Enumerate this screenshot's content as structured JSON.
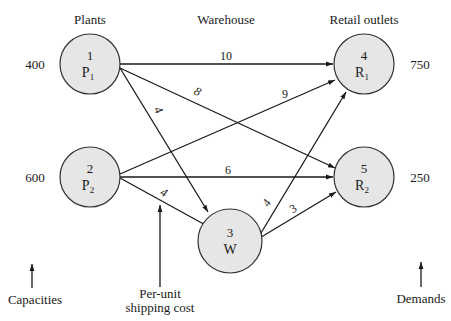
{
  "headers": {
    "plants": "Plants",
    "warehouse": "Warehouse",
    "retail": "Retail outlets"
  },
  "nodes": [
    {
      "id": "1",
      "label": "P",
      "sub": "1",
      "role": "plant",
      "cx": 90,
      "cy": 64,
      "side_value": "400"
    },
    {
      "id": "2",
      "label": "P",
      "sub": "2",
      "role": "plant",
      "cx": 90,
      "cy": 177,
      "side_value": "600"
    },
    {
      "id": "3",
      "label": "W",
      "sub": "",
      "role": "warehouse",
      "cx": 240,
      "cy": 241,
      "side_value": ""
    },
    {
      "id": "4",
      "label": "R",
      "sub": "1",
      "role": "retail",
      "cx": 364,
      "cy": 64,
      "side_value": "750"
    },
    {
      "id": "5",
      "label": "R",
      "sub": "2",
      "role": "retail",
      "cx": 364,
      "cy": 177,
      "side_value": "250"
    }
  ],
  "edges": [
    {
      "from": "1",
      "to": "4",
      "cost": "10"
    },
    {
      "from": "1",
      "to": "5",
      "cost": "8"
    },
    {
      "from": "1",
      "to": "3",
      "cost": "4"
    },
    {
      "from": "2",
      "to": "4",
      "cost": "9"
    },
    {
      "from": "2",
      "to": "5",
      "cost": "6"
    },
    {
      "from": "2",
      "to": "3",
      "cost": "4"
    },
    {
      "from": "3",
      "to": "4",
      "cost": "4"
    },
    {
      "from": "3",
      "to": "5",
      "cost": "3"
    }
  ],
  "annotations": {
    "capacities": "Capacities",
    "shipping_cost_line1": "Per-unit",
    "shipping_cost_line2": "shipping cost",
    "demands": "Demands"
  },
  "colors": {
    "node_fill": "#e6e6e6",
    "node_stroke": "#333333",
    "line": "#1a1a1a",
    "background": "#ffffff"
  }
}
